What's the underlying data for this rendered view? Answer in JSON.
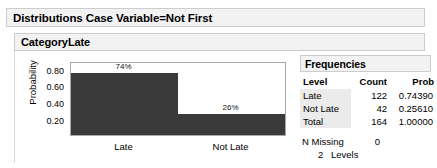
{
  "report": {
    "outline_title": "Distributions Case Variable=Not First",
    "inner_title": "CategoryLate"
  },
  "chart_data": {
    "type": "bar",
    "title": "CategoryLate",
    "xlabel": "",
    "ylabel": "Probability",
    "categories": [
      "Late",
      "Not Late"
    ],
    "values": [
      0.7439,
      0.2561
    ],
    "data_labels": [
      "74%",
      "26%"
    ],
    "ytick_labels": [
      "0.80",
      "0.60",
      "0.40",
      "0.20"
    ],
    "ytick_values": [
      0.8,
      0.6,
      0.4,
      0.2
    ],
    "ylim": [
      0.0,
      0.86
    ],
    "grid": false,
    "legend": "none",
    "bar_color": "#3a3a3a"
  },
  "frequencies": {
    "title": "Frequencies",
    "columns": [
      "Level",
      "Count",
      "Prob"
    ],
    "rows": [
      {
        "level": "Late",
        "count": "122",
        "prob": "0.74390"
      },
      {
        "level": "Not Late",
        "count": "42",
        "prob": "0.25610"
      },
      {
        "level": "Total",
        "count": "164",
        "prob": "1.00000"
      }
    ],
    "n_missing_label": "N Missing",
    "n_missing_value": "0",
    "levels_count": "2",
    "levels_label": "Levels"
  }
}
